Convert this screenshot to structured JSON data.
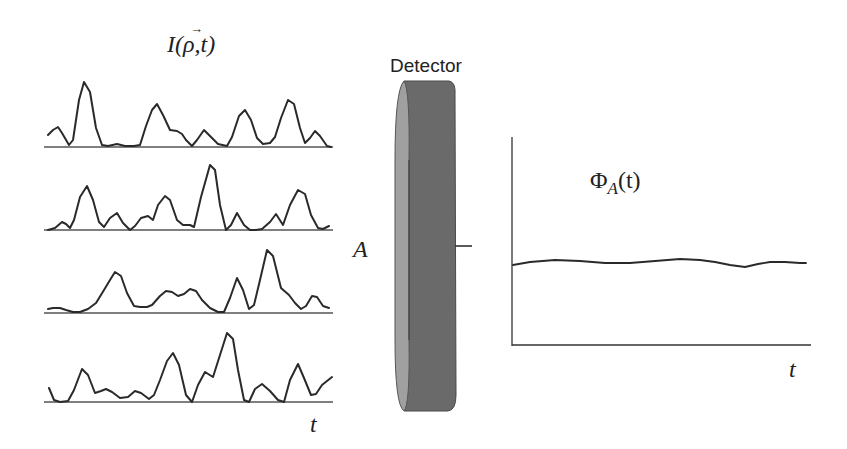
{
  "figure": {
    "left_panel": {
      "title_main": "I(",
      "title_vec": "ρ",
      "title_arrow": "→",
      "title_rest": ",t)",
      "time_label": "t",
      "description": "Four speckle intensity time traces at different positions ρ"
    },
    "detector": {
      "label": "Detector",
      "area_label": "A",
      "colors": {
        "face": "#a0a0a0",
        "body": "#6a6a6a",
        "edge": "#4a4a4a"
      }
    },
    "right_panel": {
      "title_phi": "Φ",
      "title_sub": "A",
      "title_rest": "(t)",
      "time_label": "t",
      "description": "Spatially integrated flux: nearly constant over time"
    }
  },
  "chart_data": [
    {
      "type": "line",
      "title": "I(ρ⃗,t)",
      "xlabel": "t",
      "ylabel": "",
      "grid": false,
      "series": [
        {
          "name": "trace-1",
          "baseline_y": 147,
          "points": [
            [
              48,
              135
            ],
            [
              53,
              130
            ],
            [
              58,
              127
            ],
            [
              62,
              133
            ],
            [
              69,
              145
            ],
            [
              73,
              140
            ],
            [
              79,
              100
            ],
            [
              84,
              82
            ],
            [
              90,
              92
            ],
            [
              96,
              128
            ],
            [
              102,
              145
            ],
            [
              108,
              146
            ],
            [
              117,
              144
            ],
            [
              125,
              146
            ],
            [
              134,
              146
            ],
            [
              140,
              145
            ],
            [
              146,
              126
            ],
            [
              152,
              110
            ],
            [
              157,
              104
            ],
            [
              163,
              115
            ],
            [
              170,
              130
            ],
            [
              177,
              131
            ],
            [
              182,
              134
            ],
            [
              186,
              140
            ],
            [
              192,
              146
            ],
            [
              197,
              140
            ],
            [
              204,
              130
            ],
            [
              210,
              136
            ],
            [
              218,
              144
            ],
            [
              227,
              146
            ],
            [
              232,
              137
            ],
            [
              239,
              116
            ],
            [
              245,
              110
            ],
            [
              251,
              120
            ],
            [
              257,
              138
            ],
            [
              263,
              144
            ],
            [
              270,
              143
            ],
            [
              275,
              137
            ],
            [
              281,
              118
            ],
            [
              288,
              100
            ],
            [
              294,
              104
            ],
            [
              300,
              128
            ],
            [
              305,
              143
            ],
            [
              310,
              138
            ],
            [
              315,
              131
            ],
            [
              320,
              136
            ],
            [
              327,
              146
            ],
            [
              331,
              147
            ]
          ]
        },
        {
          "name": "trace-2",
          "baseline_y": 230,
          "points": [
            [
              48,
              230
            ],
            [
              55,
              228
            ],
            [
              62,
              222
            ],
            [
              66,
              224
            ],
            [
              70,
              228
            ],
            [
              74,
              220
            ],
            [
              80,
              197
            ],
            [
              87,
              186
            ],
            [
              93,
              200
            ],
            [
              99,
              222
            ],
            [
              104,
              227
            ],
            [
              110,
              218
            ],
            [
              117,
              213
            ],
            [
              123,
              223
            ],
            [
              130,
              230
            ],
            [
              135,
              226
            ],
            [
              141,
              218
            ],
            [
              148,
              216
            ],
            [
              153,
              220
            ],
            [
              158,
              205
            ],
            [
              165,
              196
            ],
            [
              170,
              200
            ],
            [
              177,
              220
            ],
            [
              183,
              225
            ],
            [
              190,
              225
            ],
            [
              194,
              227
            ],
            [
              201,
              197
            ],
            [
              210,
              165
            ],
            [
              215,
              170
            ],
            [
              220,
              205
            ],
            [
              226,
              230
            ],
            [
              231,
              225
            ],
            [
              237,
              213
            ],
            [
              244,
              225
            ],
            [
              250,
              230
            ],
            [
              256,
              230
            ],
            [
              262,
              229
            ],
            [
              270,
              222
            ],
            [
              276,
              214
            ],
            [
              283,
              225
            ],
            [
              290,
              205
            ],
            [
              298,
              190
            ],
            [
              305,
              194
            ],
            [
              311,
              215
            ],
            [
              318,
              228
            ],
            [
              323,
              229
            ],
            [
              329,
              226
            ]
          ]
        },
        {
          "name": "trace-3",
          "baseline_y": 313,
          "points": [
            [
              48,
              309
            ],
            [
              53,
              308
            ],
            [
              60,
              308
            ],
            [
              66,
              310
            ],
            [
              73,
              312
            ],
            [
              80,
              312
            ],
            [
              88,
              309
            ],
            [
              96,
              303
            ],
            [
              104,
              290
            ],
            [
              110,
              280
            ],
            [
              115,
              272
            ],
            [
              121,
              276
            ],
            [
              127,
              293
            ],
            [
              134,
              306
            ],
            [
              140,
              307
            ],
            [
              147,
              307
            ],
            [
              152,
              305
            ],
            [
              160,
              296
            ],
            [
              166,
              291
            ],
            [
              172,
              292
            ],
            [
              178,
              296
            ],
            [
              184,
              294
            ],
            [
              190,
              289
            ],
            [
              196,
              291
            ],
            [
              202,
              300
            ],
            [
              210,
              308
            ],
            [
              218,
              312
            ],
            [
              224,
              312
            ],
            [
              230,
              298
            ],
            [
              237,
              278
            ],
            [
              243,
              290
            ],
            [
              249,
              309
            ],
            [
              254,
              305
            ],
            [
              260,
              280
            ],
            [
              267,
              250
            ],
            [
              273,
              256
            ],
            [
              281,
              288
            ],
            [
              289,
              295
            ],
            [
              295,
              303
            ],
            [
              301,
              309
            ],
            [
              306,
              306
            ],
            [
              312,
              296
            ],
            [
              317,
              297
            ],
            [
              323,
              306
            ],
            [
              329,
              308
            ]
          ]
        },
        {
          "name": "trace-4",
          "baseline_y": 402,
          "points": [
            [
              49,
              388
            ],
            [
              54,
              400
            ],
            [
              60,
              402
            ],
            [
              68,
              401
            ],
            [
              74,
              390
            ],
            [
              82,
              369
            ],
            [
              88,
              375
            ],
            [
              95,
              393
            ],
            [
              101,
              391
            ],
            [
              106,
              389
            ],
            [
              112,
              392
            ],
            [
              120,
              398
            ],
            [
              128,
              397
            ],
            [
              135,
              391
            ],
            [
              141,
              393
            ],
            [
              149,
              399
            ],
            [
              154,
              395
            ],
            [
              160,
              380
            ],
            [
              167,
              361
            ],
            [
              173,
              353
            ],
            [
              179,
              365
            ],
            [
              186,
              395
            ],
            [
              192,
              402
            ],
            [
              198,
              385
            ],
            [
              205,
              372
            ],
            [
              213,
              377
            ],
            [
              220,
              355
            ],
            [
              227,
              333
            ],
            [
              233,
              339
            ],
            [
              238,
              370
            ],
            [
              244,
              400
            ],
            [
              249,
              402
            ],
            [
              255,
              389
            ],
            [
              262,
              384
            ],
            [
              270,
              391
            ],
            [
              278,
              400
            ],
            [
              284,
              402
            ],
            [
              290,
              380
            ],
            [
              298,
              364
            ],
            [
              304,
              378
            ],
            [
              311,
              395
            ],
            [
              316,
              394
            ],
            [
              322,
              385
            ],
            [
              332,
              377
            ]
          ]
        }
      ]
    },
    {
      "type": "line",
      "title": "ΦA(t)",
      "xlabel": "t",
      "ylabel": "",
      "grid": false,
      "axes": {
        "origin": [
          512,
          345
        ],
        "y_top": 137,
        "x_right": 810
      },
      "series": [
        {
          "name": "flux",
          "points": [
            [
              513,
              265
            ],
            [
              530,
              262
            ],
            [
              555,
              260
            ],
            [
              580,
              261
            ],
            [
              605,
              263
            ],
            [
              630,
              263
            ],
            [
              655,
              261
            ],
            [
              680,
              259
            ],
            [
              700,
              260
            ],
            [
              715,
              262
            ],
            [
              730,
              265
            ],
            [
              745,
              267
            ],
            [
              758,
              264
            ],
            [
              770,
              262
            ],
            [
              785,
              262
            ],
            [
              800,
              263
            ],
            [
              806,
              263
            ]
          ]
        }
      ]
    }
  ]
}
